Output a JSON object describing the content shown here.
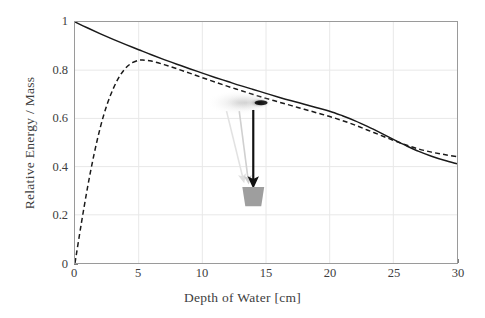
{
  "chart_data": {
    "type": "line",
    "title": "",
    "xlabel": "Depth of Water [cm]",
    "ylabel": "Relative Energy / Mass",
    "xlim": [
      0,
      30
    ],
    "ylim": [
      0,
      1
    ],
    "xticks": [
      0,
      5,
      10,
      15,
      20,
      25,
      30
    ],
    "yticks": [
      0,
      0.2,
      0.4,
      0.6,
      0.8,
      1
    ],
    "xtick_labels": [
      "0",
      "5",
      "10",
      "15",
      "20",
      "25",
      "30"
    ],
    "ytick_labels": [
      "0",
      "0.2",
      "0.4",
      "0.6",
      "0.8",
      "1"
    ],
    "grid": true,
    "legend": "none",
    "series": [
      {
        "name": "solid-curve",
        "style": "solid",
        "color": "#1a1a1a",
        "x": [
          0,
          1,
          2,
          3,
          4,
          5,
          6,
          7,
          8,
          9,
          10,
          11,
          12,
          13,
          14,
          15,
          16,
          17,
          18,
          19,
          20,
          21,
          22,
          23,
          24,
          25,
          26,
          27,
          28,
          29,
          30
        ],
        "y": [
          1.0,
          0.975,
          0.951,
          0.928,
          0.906,
          0.885,
          0.864,
          0.844,
          0.825,
          0.806,
          0.788,
          0.77,
          0.753,
          0.736,
          0.72,
          0.704,
          0.688,
          0.673,
          0.659,
          0.644,
          0.63,
          0.611,
          0.59,
          0.566,
          0.54,
          0.513,
          0.487,
          0.463,
          0.443,
          0.426,
          0.412
        ]
      },
      {
        "name": "dashed-curve",
        "style": "dashed",
        "color": "#1a1a1a",
        "x": [
          0,
          0.5,
          1,
          1.5,
          2,
          2.5,
          3,
          3.5,
          4,
          4.5,
          5,
          5.3,
          6,
          7,
          8,
          9,
          10,
          11,
          12,
          13,
          14,
          15,
          16,
          17,
          18,
          19,
          20,
          21,
          22,
          23,
          24,
          25,
          26,
          27,
          28,
          29,
          30
        ],
        "y": [
          0.0,
          0.165,
          0.318,
          0.452,
          0.565,
          0.655,
          0.723,
          0.775,
          0.81,
          0.831,
          0.841,
          0.842,
          0.838,
          0.823,
          0.806,
          0.788,
          0.769,
          0.751,
          0.733,
          0.716,
          0.699,
          0.683,
          0.668,
          0.653,
          0.638,
          0.623,
          0.608,
          0.591,
          0.572,
          0.551,
          0.53,
          0.509,
          0.49,
          0.473,
          0.46,
          0.45,
          0.441
        ]
      }
    ],
    "annotations": {
      "droplet_blob": {
        "name": "blurred-spray-ellipse",
        "center_x_cm": 13.6,
        "center_y_value": 0.665,
        "color": "#111111"
      },
      "arrows": [
        {
          "name": "light-arrow-left",
          "color": "#e2e2e2",
          "from_x_cm": 11.9,
          "from_y_value": 0.63,
          "to_x_cm": 13.2,
          "to_y_value": 0.35
        },
        {
          "name": "light-arrow-middle",
          "color": "#d0d0d0",
          "from_x_cm": 12.9,
          "from_y_value": 0.63,
          "to_x_cm": 13.6,
          "to_y_value": 0.345
        },
        {
          "name": "dark-arrow-center",
          "color": "#111111",
          "from_x_cm": 14.0,
          "from_y_value": 0.635,
          "to_x_cm": 14.0,
          "to_y_value": 0.335
        }
      ],
      "bucket": {
        "name": "collection-bucket",
        "color": "#9e9e9e",
        "center_x_cm": 14.0,
        "top_y_value": 0.315,
        "bottom_y_value": 0.235
      }
    },
    "colors": {
      "axis": "#9a9a9a",
      "grid": "#e8e8e8",
      "text": "#3d3d3d",
      "curve": "#1a1a1a",
      "bucket": "#9e9e9e",
      "arrow_dark": "#111111",
      "arrow_light": "#dcdcdc"
    }
  }
}
